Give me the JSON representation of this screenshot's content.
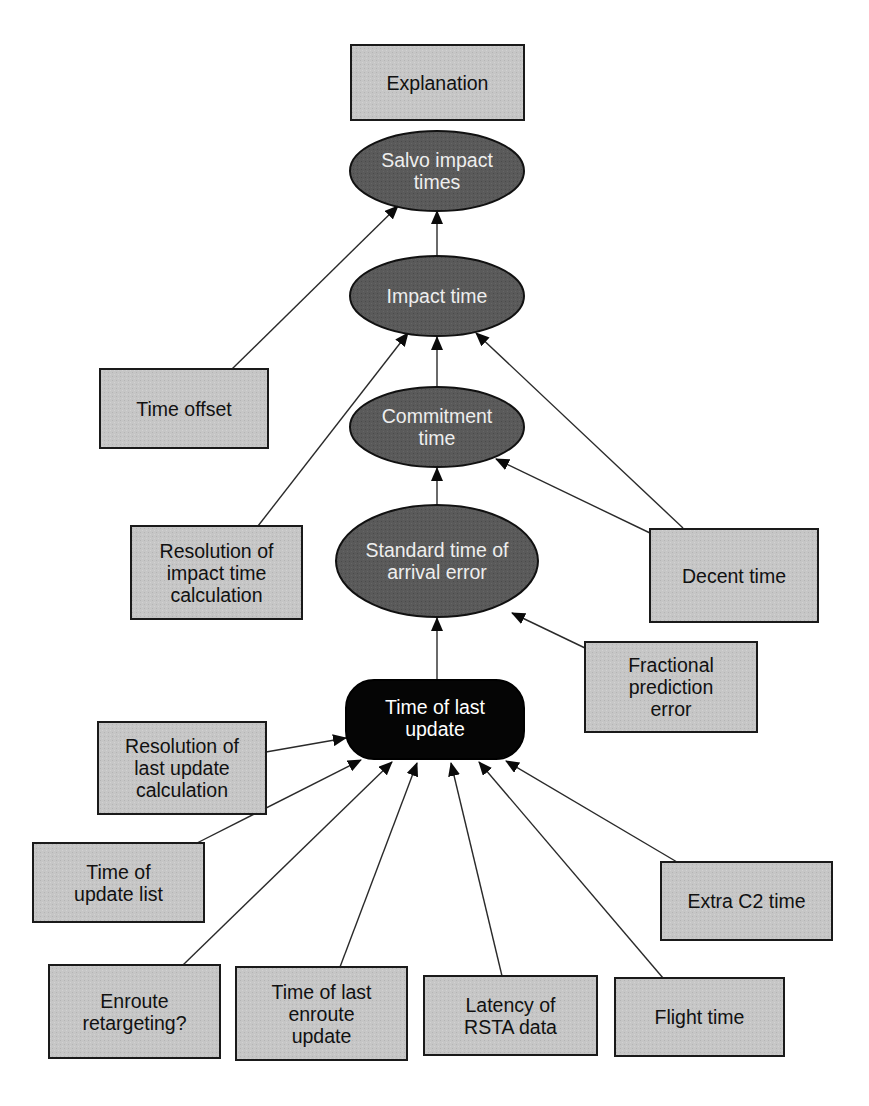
{
  "diagram": {
    "title": "",
    "colors": {
      "box_fill": "#c4c4c4",
      "box_stroke": "#1a1a1a",
      "ellipse_fill": "#595959",
      "ellipse_text": "#eeeeee",
      "root_fill": "#050505",
      "root_text": "#ffffff",
      "edge": "#2a2a2a",
      "background": "#ffffff"
    },
    "nodes": {
      "explanation": {
        "label": "Explanation",
        "shape": "box"
      },
      "salvo_impact_times": {
        "label": "Salvo impact\ntimes",
        "shape": "ellipse"
      },
      "impact_time": {
        "label": "Impact time",
        "shape": "ellipse"
      },
      "commitment_time": {
        "label": "Commitment\ntime",
        "shape": "ellipse"
      },
      "standard_time_arrival_error": {
        "label": "Standard time of\narrival error",
        "shape": "ellipse"
      },
      "time_of_last_update": {
        "label": "Time of last\nupdate",
        "shape": "rounded-rectangle"
      },
      "time_offset": {
        "label": "Time offset",
        "shape": "box"
      },
      "resolution_impact_time": {
        "label": "Resolution of\nimpact time\ncalculation",
        "shape": "box"
      },
      "decent_time": {
        "label": "Decent time",
        "shape": "box"
      },
      "fractional_prediction_error": {
        "label": "Fractional\nprediction\nerror",
        "shape": "box"
      },
      "resolution_last_update": {
        "label": "Resolution of\nlast update\ncalculation",
        "shape": "box"
      },
      "time_of_update_list": {
        "label": "Time of\nupdate list",
        "shape": "box"
      },
      "extra_c2_time": {
        "label": "Extra C2 time",
        "shape": "box"
      },
      "enroute_retargeting": {
        "label": "Enroute\nretargeting?",
        "shape": "box"
      },
      "time_last_enroute_update": {
        "label": "Time of last\nenroute\nupdate",
        "shape": "box"
      },
      "latency_rsta_data": {
        "label": "Latency of\nRSTA data",
        "shape": "box"
      },
      "flight_time": {
        "label": "Flight time",
        "shape": "box"
      }
    },
    "edges": [
      {
        "from": "impact_time",
        "to": "salvo_impact_times"
      },
      {
        "from": "time_offset",
        "to": "salvo_impact_times"
      },
      {
        "from": "commitment_time",
        "to": "impact_time"
      },
      {
        "from": "resolution_impact_time",
        "to": "impact_time"
      },
      {
        "from": "decent_time",
        "to": "impact_time"
      },
      {
        "from": "standard_time_arrival_error",
        "to": "commitment_time"
      },
      {
        "from": "decent_time",
        "to": "commitment_time"
      },
      {
        "from": "time_of_last_update",
        "to": "standard_time_arrival_error"
      },
      {
        "from": "fractional_prediction_error",
        "to": "standard_time_arrival_error"
      },
      {
        "from": "resolution_last_update",
        "to": "time_of_last_update"
      },
      {
        "from": "time_of_update_list",
        "to": "time_of_last_update"
      },
      {
        "from": "enroute_retargeting",
        "to": "time_of_last_update"
      },
      {
        "from": "time_last_enroute_update",
        "to": "time_of_last_update"
      },
      {
        "from": "latency_rsta_data",
        "to": "time_of_last_update"
      },
      {
        "from": "flight_time",
        "to": "time_of_last_update"
      },
      {
        "from": "extra_c2_time",
        "to": "time_of_last_update"
      }
    ]
  }
}
